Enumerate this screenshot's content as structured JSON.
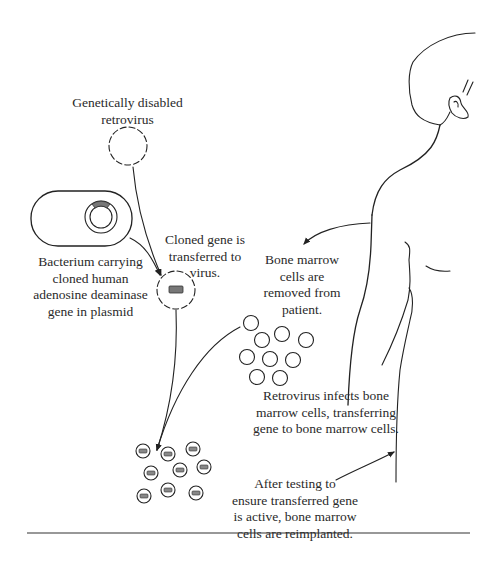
{
  "diagram": {
    "labels": {
      "retrovirus": "Genetically disabled\nretrovirus",
      "bacterium": "Bacterium carrying\ncloned human\nadenosine deaminase\ngene in plasmid",
      "cloned_gene": "Cloned gene is\ntransferred to\nvirus.",
      "bone_marrow_removed": "Bone marrow\ncells are\nremoved from\npatient.",
      "retrovirus_infects": "Retrovirus infects bone\nmarrow cells, transferring\ngene to bone marrow cells.",
      "reimplanted": "After testing to\nensure transferred gene\nis active, bone marrow\ncells are reimplanted."
    },
    "elements": {
      "retrovirus": "dashed-circle",
      "bacterium": "rounded-capsule-with-plasmid",
      "plasmid_gene": "gray-arc-segment",
      "recombinant_virus": "dashed-circle-with-gene",
      "bone_marrow_cells_count": 9,
      "transduced_cells_count": 9,
      "patient": "outline-of-human-upper-body"
    },
    "steps": [
      "Genetically disabled retrovirus",
      "Bacterium carrying cloned human adenosine deaminase gene in plasmid",
      "Cloned gene is transferred to virus.",
      "Bone marrow cells are removed from patient.",
      "Retrovirus infects bone marrow cells, transferring gene to bone marrow cells.",
      "After testing to ensure transferred gene is active, bone marrow cells are reimplanted."
    ],
    "colors": {
      "line": "#222222",
      "gene": "#777777",
      "text": "#2a2a2a",
      "background": "#ffffff"
    }
  }
}
